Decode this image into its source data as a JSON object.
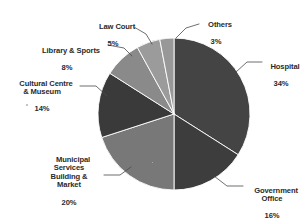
{
  "chart_data": {
    "type": "pie",
    "title": "",
    "subtitle": "",
    "xlabel": "",
    "ylabel": "",
    "legend_position": "none",
    "grid": false,
    "units": "percent",
    "start_angle_deg": 0,
    "direction": "clockwise",
    "categories": [
      "Hospital",
      "Government Office",
      "Municipal Services Building & Market",
      "Cultural Centre & Museum",
      "Library & Sports",
      "Law Court",
      "Others"
    ],
    "values": [
      34,
      16,
      20,
      14,
      8,
      5,
      3
    ],
    "colors": [
      "#444444",
      "#3d3d3d",
      "#787878",
      "#3a3a3a",
      "#8a8a8a",
      "#9b9b9b",
      "#989898"
    ],
    "slices": [
      {
        "name": "Hospital",
        "value": 34,
        "label": "Hospital",
        "percent": "34%",
        "color": "#444444"
      },
      {
        "name": "Government Office",
        "value": 16,
        "label": "Government\nOffice",
        "percent": "16%",
        "color": "#3d3d3d"
      },
      {
        "name": "Municipal Services Building & Market",
        "value": 20,
        "label": "Municipal\nServices\nBuilding &\nMarket",
        "percent": "20%",
        "color": "#787878"
      },
      {
        "name": "Cultural Centre & Museum",
        "value": 14,
        "label": "Cultural Centre\n& Museum",
        "percent": "14%",
        "color": "#3a3a3a"
      },
      {
        "name": "Library & Sports",
        "value": 8,
        "label": "Library & Sports",
        "percent": "8%",
        "color": "#8a8a8a"
      },
      {
        "name": "Law Court",
        "value": 5,
        "label": "Law Court",
        "percent": "5%",
        "color": "#9b9b9b"
      },
      {
        "name": "Others",
        "value": 3,
        "label": "Others",
        "percent": "3%",
        "color": "#989898"
      }
    ]
  },
  "labels": {
    "hospital": {
      "text": "Hospital",
      "pct": "34%"
    },
    "government_office": {
      "text": "Government\nOffice",
      "pct": "16%"
    },
    "municipal": {
      "text": "Municipal\nServices\nBuilding &\nMarket",
      "pct": "20%"
    },
    "cultural_centre": {
      "text": "Cultural Centre\n& Museum",
      "pct": "14%"
    },
    "library_sports": {
      "text": "Library & Sports",
      "pct": "8%"
    },
    "law_court": {
      "text": "Law Court",
      "pct": "5%"
    },
    "others": {
      "text": "Others",
      "pct": "3%"
    }
  },
  "style": {
    "background": "#ffffff",
    "text_color": "#2b2b2b",
    "leader_color": "#4a4a4a"
  }
}
